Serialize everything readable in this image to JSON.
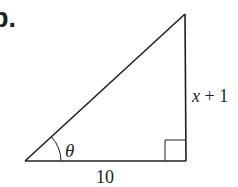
{
  "problem_label": "b.",
  "diagram": {
    "type": "right-triangle",
    "labels": {
      "angle": "θ",
      "base": "10",
      "height": "x + 1"
    },
    "stroke_color": "#231f20",
    "background": "#ffffff"
  }
}
